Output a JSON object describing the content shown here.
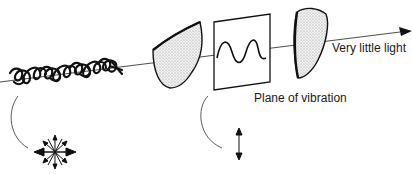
{
  "diagram": {
    "labels": {
      "output_light": "Very little light",
      "plane": "Plane of vibration"
    },
    "components": [
      {
        "name": "unpolarized-light",
        "description": "Tangled wave representing unpolarized light"
      },
      {
        "name": "first-polarizer",
        "description": "Shaded polarizing filter"
      },
      {
        "name": "plane-of-vibration-panel",
        "description": "Rectangular frame with sine wave"
      },
      {
        "name": "second-polarizer",
        "description": "Shaded polarizing filter (analyzer)"
      }
    ],
    "colors": {
      "stroke": "#111111",
      "fill_shaded": "#e6e6e6"
    }
  }
}
